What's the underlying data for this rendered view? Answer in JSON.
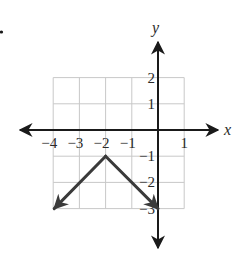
{
  "chart_data": {
    "type": "line",
    "title": "",
    "xlabel": "x",
    "ylabel": "y",
    "xlim": [
      -4,
      1
    ],
    "ylim": [
      -3,
      2
    ],
    "grid": true,
    "x_ticks": [
      -4,
      -3,
      -2,
      -1,
      1
    ],
    "y_ticks": [
      2,
      1,
      -1,
      -2,
      -3
    ],
    "x_tick_labels": [
      "−4",
      "−3",
      "−2",
      "−1",
      "1"
    ],
    "y_tick_labels": [
      "2",
      "1",
      "−1",
      "−2",
      "−3"
    ],
    "series": [
      {
        "name": "absolute value graph",
        "description": "Inverted V with vertex at (-2, -1), rays extending with arrows toward (-4, -3) and (0, -3)",
        "points": [
          {
            "x": -4,
            "y": -3
          },
          {
            "x": -2,
            "y": -1
          },
          {
            "x": 0,
            "y": -3
          }
        ],
        "vertex": {
          "x": -2,
          "y": -1
        },
        "equation_implied": "y = -|x + 2| - 1",
        "arrows_at_ends": true
      }
    ],
    "legend": null
  },
  "colors": {
    "axis": "#1a1a1a",
    "grid": "#c8c8c8",
    "curve": "#3a3a3a",
    "text": "#2a2a2a"
  }
}
